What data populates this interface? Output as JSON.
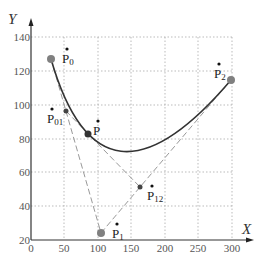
{
  "axes": {
    "x_label": "X",
    "y_label": "Y",
    "x_ticks": [
      "0",
      "50",
      "100",
      "150",
      "200",
      "250",
      "300"
    ],
    "y_ticks": [
      "20",
      "40",
      "60",
      "80",
      "100",
      "120",
      "140"
    ],
    "xlim": [
      0,
      300
    ],
    "ylim": [
      20,
      140
    ]
  },
  "labels": {
    "p0": {
      "base": "P",
      "sub": "0"
    },
    "p1": {
      "base": "P",
      "sub": "1"
    },
    "p2": {
      "base": "P",
      "sub": "2"
    },
    "p01": {
      "base": "P",
      "sub": "01"
    },
    "p12": {
      "base": "P",
      "sub": "12"
    },
    "p": {
      "base": "P",
      "sub": ""
    }
  },
  "colors": {
    "curve": "#333333",
    "control_point": "#808080",
    "dashed_line": "#999999",
    "grid": "#aaaaaa",
    "axis": "#333333"
  },
  "points": {
    "P0": [
      30,
      127
    ],
    "P1": [
      105,
      24
    ],
    "P2": [
      300,
      115
    ],
    "P01": [
      52,
      96
    ],
    "P12": [
      162,
      51
    ],
    "P": [
      85,
      83
    ]
  }
}
